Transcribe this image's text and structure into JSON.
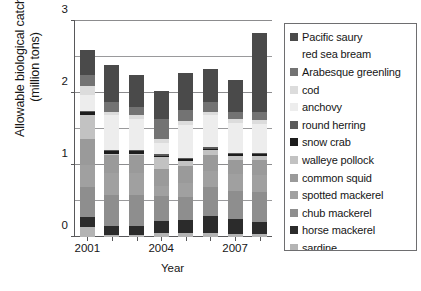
{
  "chart_data": {
    "type": "bar",
    "subtype": "stacked-bar",
    "title": "",
    "xlabel": "Year",
    "ylabel": "Allowable biological catch (million tons)",
    "ylabel_lines": [
      "Allowable biological catch",
      "(million tons)"
    ],
    "categories": [
      "2001",
      "2002",
      "2003",
      "2004",
      "2005",
      "2006",
      "2007",
      "2008"
    ],
    "xtick_labels_shown": [
      "2001",
      "2004",
      "2007"
    ],
    "ylim": [
      0,
      3
    ],
    "ytick_labels": [
      "0",
      "1",
      "2",
      "3"
    ],
    "ytick_values": [
      0,
      1,
      2,
      3
    ],
    "gridlines": [
      0.5,
      1,
      1.5,
      2,
      2.5,
      3
    ],
    "grid": true,
    "legend_position": "right-outside",
    "series": [
      {
        "name": "sardine",
        "color": "#b4b4b4",
        "values": [
          0.14,
          0.03,
          0.03,
          0.05,
          0.05,
          0.05,
          0.04,
          0.04
        ]
      },
      {
        "name": "horse mackerel",
        "color": "#2b2b2b",
        "values": [
          0.14,
          0.12,
          0.12,
          0.17,
          0.18,
          0.24,
          0.21,
          0.17
        ]
      },
      {
        "name": "chub mackerel",
        "color": "#8e8e8e",
        "values": [
          0.42,
          0.44,
          0.44,
          0.35,
          0.32,
          0.41,
          0.39,
          0.42
        ]
      },
      {
        "name": "spotted mackerel",
        "color": "#a0a0a0",
        "values": [
          0.3,
          0.3,
          0.3,
          0.14,
          0.2,
          0.22,
          0.23,
          0.23
        ]
      },
      {
        "name": "common squid",
        "color": "#9a9a9a",
        "values": [
          0.36,
          0.25,
          0.25,
          0.23,
          0.24,
          0.22,
          0.2,
          0.21
        ]
      },
      {
        "name": "walleye pollock",
        "color": "#c2c2c2",
        "values": [
          0.34,
          0.02,
          0.02,
          0.17,
          0.07,
          0.07,
          0.06,
          0.06
        ]
      },
      {
        "name": "snow crab",
        "color": "#1c1c1c",
        "values": [
          0.03,
          0.03,
          0.03,
          0.02,
          0.02,
          0.02,
          0.02,
          0.02
        ]
      },
      {
        "name": "round herring",
        "color": "#5a5a5a",
        "values": [
          0.02,
          0.02,
          0.02,
          0.02,
          0.02,
          0.02,
          0.02,
          0.02
        ]
      },
      {
        "name": "anchovy",
        "color": "#ededed",
        "values": [
          0.22,
          0.48,
          0.43,
          0.16,
          0.46,
          0.44,
          0.42,
          0.4
        ]
      },
      {
        "name": "cod",
        "color": "#dcdcdc",
        "values": [
          0.13,
          0.05,
          0.05,
          0.05,
          0.05,
          0.05,
          0.05,
          0.05
        ]
      },
      {
        "name": "Arabesque greenling",
        "color": "#737373",
        "values": [
          0.15,
          0.14,
          0.11,
          0.28,
          0.16,
          0.14,
          0.1,
          0.12
        ]
      },
      {
        "name": "Pacific saury",
        "color": "#4a4a4a",
        "values": [
          0.35,
          0.51,
          0.45,
          0.39,
          0.51,
          0.46,
          0.44,
          1.1
        ]
      }
    ],
    "totals": [
      2.6,
      2.32,
      2.2,
      1.98,
      2.28,
      2.27,
      2.14,
      2.72
    ],
    "legend_entries": [
      {
        "label": "Pacific saury",
        "color": "#4a4a4a",
        "has_swatch": true
      },
      {
        "label": "red sea bream",
        "color": "",
        "has_swatch": false
      },
      {
        "label": "Arabesque greenling",
        "color": "#737373",
        "has_swatch": true
      },
      {
        "label": "cod",
        "color": "#dcdcdc",
        "has_swatch": true
      },
      {
        "label": "anchovy",
        "color": "#ededed",
        "has_swatch": true
      },
      {
        "label": "round herring",
        "color": "#5a5a5a",
        "has_swatch": true
      },
      {
        "label": "snow crab",
        "color": "#1c1c1c",
        "has_swatch": true
      },
      {
        "label": "walleye pollock",
        "color": "#c2c2c2",
        "has_swatch": true
      },
      {
        "label": "common squid",
        "color": "#9a9a9a",
        "has_swatch": true
      },
      {
        "label": "spotted mackerel",
        "color": "#a0a0a0",
        "has_swatch": true
      },
      {
        "label": "chub mackerel",
        "color": "#8e8e8e",
        "has_swatch": true
      },
      {
        "label": "horse mackerel",
        "color": "#2b2b2b",
        "has_swatch": true
      },
      {
        "label": "sardine",
        "color": "#b4b4b4",
        "has_swatch": true
      }
    ]
  }
}
